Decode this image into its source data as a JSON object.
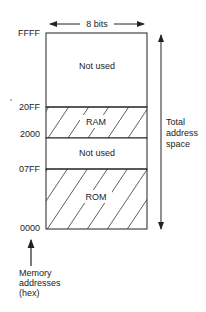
{
  "width_label": "8 bits",
  "regions": [
    {
      "label": "Not used",
      "hatched": false,
      "top": "FFFF"
    },
    {
      "label": "RAM",
      "hatched": true,
      "top": "20FF"
    },
    {
      "label": "Not used",
      "hatched": false,
      "top": "2000"
    },
    {
      "label": "ROM",
      "hatched": true,
      "top": "07FF"
    }
  ],
  "addresses": [
    "FFFF",
    "20FF",
    "2000",
    "07FF",
    "0000"
  ],
  "total_label": [
    "Total",
    "address",
    "space"
  ],
  "axis_label": [
    "Memory",
    "addresses",
    "(hex)"
  ]
}
